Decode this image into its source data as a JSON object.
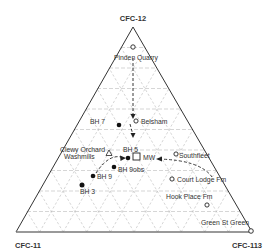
{
  "diagram": {
    "type": "ternary",
    "vertices": {
      "top": "CFC-12",
      "bottom_left": "CFC-11",
      "bottom_right": "CFC-113"
    },
    "points": [
      {
        "label": "Pinden Quarry",
        "marker": "open-circle"
      },
      {
        "label": "BH 7",
        "marker": "filled-circle"
      },
      {
        "label": "Belsham",
        "marker": "open-circle"
      },
      {
        "label": "Clewy Orchard Washmills",
        "marker": "open-triangle"
      },
      {
        "label": "BH 5",
        "marker": "filled-circle"
      },
      {
        "label": "MW",
        "marker": "open-square"
      },
      {
        "label": "BH 9obs",
        "marker": "filled-circle"
      },
      {
        "label": "BH 9",
        "marker": "filled-circle"
      },
      {
        "label": "BH 3",
        "marker": "filled-circle"
      },
      {
        "label": "Southfleet",
        "marker": "open-circle"
      },
      {
        "label": "Court Lodge Fm",
        "marker": "open-circle"
      },
      {
        "label": "Hook Place Fm",
        "marker": "open-circle"
      },
      {
        "label": "Green St Green",
        "marker": "open-circle"
      }
    ],
    "labels": {
      "pinden": "Pinden Quarry",
      "bh7": "BH 7",
      "belsham": "Belsham",
      "clewy1": "Clewy Orchard",
      "clewy2": "Washmills",
      "bh5": "BH 5",
      "mw": "MW",
      "bh9obs": "BH 9obs",
      "bh9": "BH 9",
      "bh3": "BH 3",
      "southfleet": "Southfleet",
      "court": "Court Lodge Fm",
      "hook": "Hook Place Fm",
      "green": "Green St Green"
    }
  }
}
